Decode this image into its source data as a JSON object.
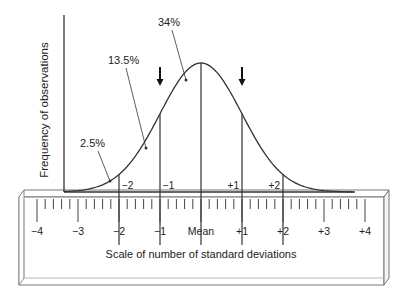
{
  "diagram": {
    "type": "normal-distribution-ruler",
    "y_axis_label": "Frequency of observations",
    "x_axis_label": "Scale of number of standard deviations",
    "percent_labels": [
      {
        "text": "34%",
        "region": "mean to 1 SD"
      },
      {
        "text": "13.5%",
        "region": "1 SD to 2 SD"
      },
      {
        "text": "2.5%",
        "region": "beyond 2 SD"
      }
    ],
    "curve_sd_labels": [
      "−2",
      "−1",
      "+1",
      "+2"
    ],
    "ruler_labels": [
      "−4",
      "−3",
      "−2",
      "−1",
      "Mean",
      "+1",
      "+2",
      "+3",
      "+4"
    ],
    "ruler_minor_divisions_per_sd": 5,
    "sd_lines": [
      -2,
      -1,
      0,
      1,
      2
    ],
    "arrows_at_sd": [
      -1,
      1
    ],
    "colors": {
      "line": "#333333",
      "text": "#222222",
      "ruler_edge": "#777777"
    }
  }
}
